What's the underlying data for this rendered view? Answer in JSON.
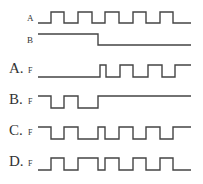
{
  "inputs": [
    {
      "label": "A",
      "y_high": 12,
      "y_low": 23,
      "start_level": 0,
      "transitions": [
        38,
        51,
        64,
        78,
        92,
        105,
        119,
        133,
        146,
        160,
        173,
        191
      ]
    },
    {
      "label": "B",
      "y_high": 34,
      "y_low": 45,
      "start_level": 1,
      "transitions": [
        38,
        98,
        191
      ]
    }
  ],
  "options": [
    {
      "letter": "A.",
      "signal": "F",
      "label_y": 73,
      "y_high": 65,
      "y_low": 77,
      "start_level": 0,
      "transitions": [
        38,
        100,
        106,
        120,
        133,
        148,
        162,
        175,
        191
      ]
    },
    {
      "letter": "B.",
      "signal": "F",
      "label_y": 104,
      "y_high": 96,
      "y_low": 108,
      "start_level": 1,
      "transitions": [
        38,
        51,
        64,
        78,
        98,
        191
      ]
    },
    {
      "letter": "C.",
      "signal": "F",
      "label_y": 135,
      "y_high": 127,
      "y_low": 139,
      "start_level": 1,
      "transitions": [
        38,
        51,
        64,
        78,
        98,
        105,
        119,
        133,
        146,
        160,
        173,
        191
      ]
    },
    {
      "letter": "D.",
      "signal": "F",
      "label_y": 166,
      "y_high": 158,
      "y_low": 170,
      "start_level": 0,
      "transitions": [
        38,
        51,
        64,
        78,
        98,
        105,
        119,
        133,
        146,
        160,
        173,
        191
      ]
    }
  ],
  "colors": {
    "stroke": "#444444",
    "text": "#333333",
    "background": "#ffffff"
  }
}
